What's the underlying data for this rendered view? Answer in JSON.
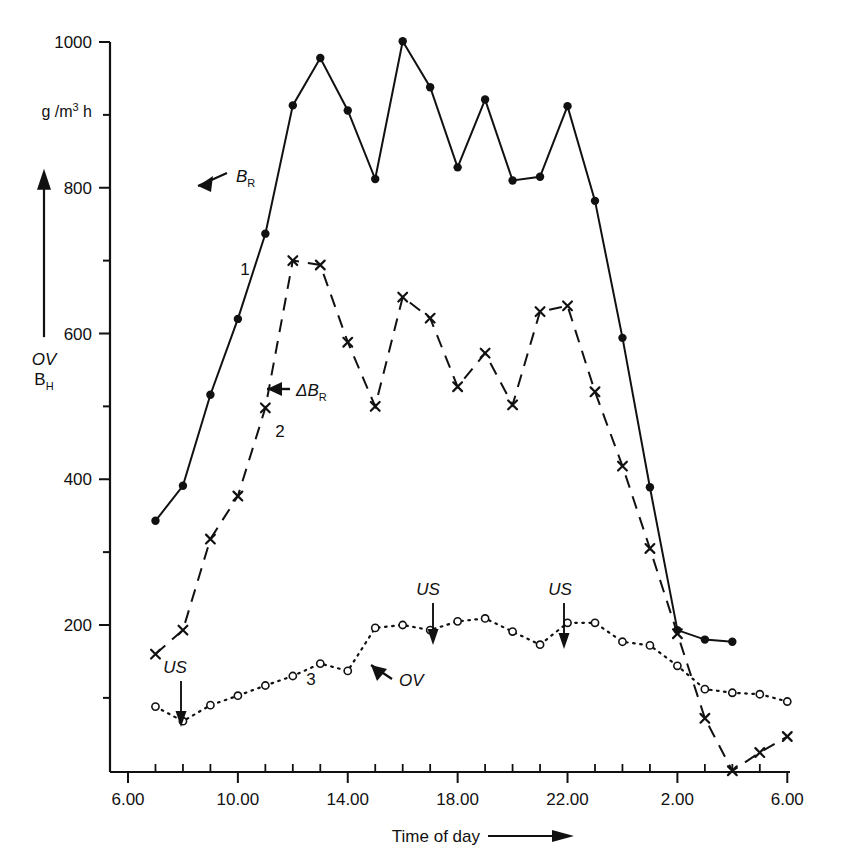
{
  "figure": {
    "yaxis_unit": "g/m³ h",
    "yaxis_unit_parts": {
      "pre": "g",
      "sep": "/",
      "m": "m",
      "exp": "3",
      "post": "h"
    },
    "yaxis_name_top": "OV",
    "yaxis_name_bottom": "B",
    "yaxis_name_bottom_sub": "H",
    "xaxis_title": "Time of day",
    "xaxis_arrow": "→"
  },
  "annotations": {
    "br_label_base": "B",
    "br_label_sub": "R",
    "delta_br_prefix": "Δ",
    "delta_br_base": "B",
    "delta_br_sub": "R",
    "ov_label": "OV",
    "us_label": "US",
    "curve1": "1",
    "curve2": "2",
    "curve3": "3",
    "us_markers": [
      {
        "label": "US",
        "hour": 8
      },
      {
        "label": "US",
        "hour": 16.5
      },
      {
        "label": "US",
        "hour": 21
      }
    ]
  },
  "chart_data": {
    "type": "line",
    "title": "",
    "xlabel": "Time of day",
    "ylabel": "OV, B_H",
    "yunit": "g/m³ h",
    "xlim": [
      6,
      30
    ],
    "ylim": [
      0,
      1030
    ],
    "grid": false,
    "legend": "none",
    "y_major_ticks": [
      200,
      400,
      600,
      800,
      1000
    ],
    "y_minor_ticks": [
      100,
      300,
      500,
      700,
      900
    ],
    "x_tick_labels": [
      "6.00",
      "10.00",
      "14.00",
      "18.00",
      "22.00",
      "2.00",
      "6.00"
    ],
    "x_tick_label_hours": [
      6,
      10,
      14,
      18,
      22,
      26,
      30
    ],
    "x_minor_tick_hours": [
      7,
      8,
      9,
      11,
      12,
      13,
      15,
      16,
      17,
      19,
      20,
      21,
      23,
      24,
      25,
      27,
      28,
      29
    ],
    "series": [
      {
        "name": "B_R",
        "number": "1",
        "style": "solid",
        "marker": "filled-circle",
        "x": [
          7,
          8,
          9,
          10,
          11,
          12,
          13,
          14,
          15,
          16,
          17,
          18,
          19,
          20,
          21,
          22,
          23,
          24,
          25,
          26,
          27,
          28,
          29,
          30
        ],
        "values": [
          343,
          391,
          516,
          620,
          737,
          913,
          978,
          906,
          812,
          1001,
          938,
          828,
          921,
          810,
          815,
          912,
          782,
          594,
          389,
          193,
          180,
          177,
          null,
          null
        ]
      },
      {
        "name": "ΔB_R",
        "number": "2",
        "style": "dashed",
        "marker": "cross",
        "x": [
          7,
          8,
          9,
          10,
          11,
          12,
          13,
          14,
          15,
          16,
          17,
          18,
          19,
          20,
          21,
          22,
          23,
          24,
          25,
          26,
          27,
          28,
          29,
          30
        ],
        "values": [
          160,
          193,
          318,
          377,
          498,
          700,
          694,
          588,
          500,
          650,
          621,
          527,
          573,
          502,
          630,
          638,
          520,
          418,
          305,
          188,
          72,
          0,
          25,
          47
        ]
      },
      {
        "name": "OV",
        "number": "3",
        "style": "dotted",
        "marker": "open-circle",
        "x": [
          7,
          8,
          9,
          10,
          11,
          12,
          13,
          14,
          15,
          16,
          17,
          18,
          19,
          20,
          21,
          22,
          23,
          24,
          25,
          26,
          27,
          28,
          29,
          30
        ],
        "values": [
          88,
          68,
          90,
          103,
          117,
          130,
          147,
          137,
          196,
          200,
          193,
          205,
          209,
          191,
          173,
          203,
          203,
          177,
          172,
          144,
          112,
          107,
          105,
          95
        ]
      }
    ]
  }
}
